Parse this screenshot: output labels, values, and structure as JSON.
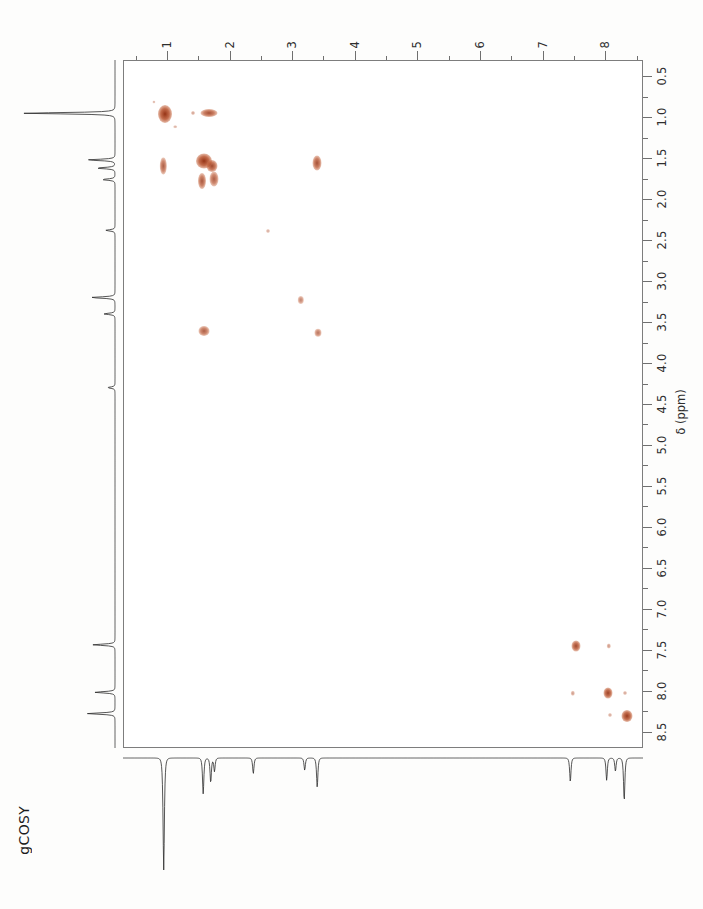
{
  "experiment": {
    "label": "gCOSY"
  },
  "axes": {
    "unit_label": "δ (ppm)",
    "f2_top": {
      "orientation": "horizontal-top",
      "direction": "left-to-right-increasing",
      "min": 0.3,
      "max": 8.6,
      "tick_labels": [
        "1",
        "2",
        "3",
        "4",
        "5",
        "6",
        "7",
        "8"
      ],
      "tick_values": [
        1,
        2,
        3,
        4,
        5,
        6,
        7,
        8
      ],
      "minor_step": 0.5
    },
    "f1_right": {
      "orientation": "vertical-right",
      "direction": "top-to-bottom-increasing",
      "min": 0.3,
      "max": 8.7,
      "tick_labels": [
        "0.5",
        "1.0",
        "1.5",
        "2.0",
        "2.5",
        "3.0",
        "3.5",
        "4.0",
        "4.5",
        "5.0",
        "5.5",
        "6.0",
        "6.5",
        "7.0",
        "7.5",
        "8.0",
        "8.5"
      ],
      "tick_values": [
        0.5,
        1.0,
        1.5,
        2.0,
        2.5,
        3.0,
        3.5,
        4.0,
        4.5,
        5.0,
        5.5,
        6.0,
        6.5,
        7.0,
        7.5,
        8.0,
        8.5
      ],
      "minor_step": 0.25
    }
  },
  "chart_data": {
    "type": "scatter",
    "title": "gCOSY",
    "xlabel": "δ (ppm)",
    "ylabel": "δ (ppm)",
    "xlim": [
      0.3,
      8.6
    ],
    "ylim": [
      8.7,
      0.3
    ],
    "grid": false,
    "legend": "none",
    "contour_color": "#b8512b",
    "peaks": [
      {
        "f2": 0.95,
        "f1": 0.95,
        "rx": 7.0,
        "ry": 9.0,
        "intensity": 1.0,
        "kind": "diagonal"
      },
      {
        "f2": 0.78,
        "f1": 0.8,
        "rx": 1.6,
        "ry": 1.6,
        "intensity": 0.12,
        "kind": "noise"
      },
      {
        "f2": 1.12,
        "f1": 1.1,
        "rx": 1.8,
        "ry": 1.8,
        "intensity": 0.14,
        "kind": "noise"
      },
      {
        "f2": 1.65,
        "f1": 0.93,
        "rx": 8.5,
        "ry": 4.0,
        "intensity": 0.8,
        "kind": "cross"
      },
      {
        "f2": 1.4,
        "f1": 0.93,
        "rx": 2.0,
        "ry": 2.0,
        "intensity": 0.25,
        "kind": "cross"
      },
      {
        "f2": 0.93,
        "f1": 1.58,
        "rx": 3.2,
        "ry": 8.5,
        "intensity": 0.7,
        "kind": "cross"
      },
      {
        "f2": 1.58,
        "f1": 1.52,
        "rx": 8.0,
        "ry": 7.5,
        "intensity": 1.0,
        "kind": "diagonal"
      },
      {
        "f2": 1.7,
        "f1": 1.58,
        "rx": 5.5,
        "ry": 6.0,
        "intensity": 0.85,
        "kind": "diagonal"
      },
      {
        "f2": 1.55,
        "f1": 1.76,
        "rx": 4.0,
        "ry": 8.0,
        "intensity": 0.75,
        "kind": "cross"
      },
      {
        "f2": 1.74,
        "f1": 1.74,
        "rx": 4.5,
        "ry": 7.5,
        "intensity": 0.7,
        "kind": "diagonal"
      },
      {
        "f2": 3.38,
        "f1": 1.55,
        "rx": 4.5,
        "ry": 7.5,
        "intensity": 0.8,
        "kind": "cross"
      },
      {
        "f2": 2.6,
        "f1": 2.38,
        "rx": 2.0,
        "ry": 2.0,
        "intensity": 0.18,
        "kind": "cross"
      },
      {
        "f2": 3.12,
        "f1": 3.22,
        "rx": 3.2,
        "ry": 4.0,
        "intensity": 0.45,
        "kind": "diagonal"
      },
      {
        "f2": 3.4,
        "f1": 3.62,
        "rx": 3.5,
        "ry": 4.2,
        "intensity": 0.55,
        "kind": "cross"
      },
      {
        "f2": 1.57,
        "f1": 3.6,
        "rx": 5.5,
        "ry": 5.0,
        "intensity": 0.7,
        "kind": "cross"
      },
      {
        "f2": 7.52,
        "f1": 7.44,
        "rx": 4.5,
        "ry": 5.5,
        "intensity": 0.85,
        "kind": "diagonal"
      },
      {
        "f2": 8.04,
        "f1": 7.44,
        "rx": 2.2,
        "ry": 2.5,
        "intensity": 0.3,
        "kind": "cross"
      },
      {
        "f2": 7.46,
        "f1": 8.02,
        "rx": 2.2,
        "ry": 2.2,
        "intensity": 0.28,
        "kind": "cross"
      },
      {
        "f2": 8.02,
        "f1": 8.02,
        "rx": 4.5,
        "ry": 5.5,
        "intensity": 0.9,
        "kind": "diagonal"
      },
      {
        "f2": 8.3,
        "f1": 8.02,
        "rx": 2.0,
        "ry": 2.0,
        "intensity": 0.22,
        "kind": "cross"
      },
      {
        "f2": 8.06,
        "f1": 8.28,
        "rx": 2.0,
        "ry": 2.0,
        "intensity": 0.2,
        "kind": "cross"
      },
      {
        "f2": 8.33,
        "f1": 8.3,
        "rx": 5.5,
        "ry": 6.0,
        "intensity": 0.95,
        "kind": "diagonal"
      }
    ]
  },
  "projections": {
    "f2_bottom": {
      "orientation": "bottom",
      "direction": "downward-peaks",
      "peaks": [
        {
          "ppm": 0.95,
          "height": 1.0
        },
        {
          "ppm": 1.58,
          "height": 0.32
        },
        {
          "ppm": 1.7,
          "height": 0.22
        },
        {
          "ppm": 1.76,
          "height": 0.12
        },
        {
          "ppm": 2.38,
          "height": 0.14
        },
        {
          "ppm": 3.2,
          "height": 0.11
        },
        {
          "ppm": 3.4,
          "height": 0.26
        },
        {
          "ppm": 7.44,
          "height": 0.21
        },
        {
          "ppm": 8.02,
          "height": 0.2
        },
        {
          "ppm": 8.16,
          "height": 0.12
        },
        {
          "ppm": 8.3,
          "height": 0.38
        }
      ]
    },
    "f1_left": {
      "orientation": "left",
      "direction": "leftward-peaks",
      "peaks": [
        {
          "ppm": 0.95,
          "height": 1.0
        },
        {
          "ppm": 1.52,
          "height": 0.3
        },
        {
          "ppm": 1.62,
          "height": 0.2
        },
        {
          "ppm": 1.76,
          "height": 0.14
        },
        {
          "ppm": 2.38,
          "height": 0.1
        },
        {
          "ppm": 3.2,
          "height": 0.26
        },
        {
          "ppm": 3.4,
          "height": 0.12
        },
        {
          "ppm": 4.3,
          "height": 0.08
        },
        {
          "ppm": 7.44,
          "height": 0.24
        },
        {
          "ppm": 8.02,
          "height": 0.22
        },
        {
          "ppm": 8.28,
          "height": 0.3
        }
      ]
    }
  }
}
